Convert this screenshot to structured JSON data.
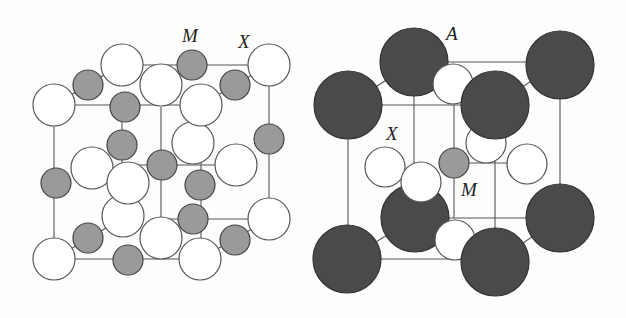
{
  "figure": {
    "panels": [
      {
        "id": "rock-salt",
        "description": "Rock-salt (NaCl-type) MX unit cell",
        "labels": [
          {
            "text": "M",
            "x": 191,
            "y": 42
          },
          {
            "text": "X",
            "x": 244,
            "y": 48
          }
        ]
      },
      {
        "id": "perovskite",
        "description": "Perovskite AMX3 unit cell",
        "labels": [
          {
            "text": "A",
            "x": 446,
            "y": 36
          },
          {
            "text": "X",
            "x": 392,
            "y": 138
          },
          {
            "text": "M",
            "x": 466,
            "y": 192
          }
        ]
      }
    ],
    "legend": {
      "M": "small gray atom (metal cation)",
      "X": "white atom (anion)",
      "A": "large dark atom (A-site cation)"
    },
    "colors": {
      "atom_M": "#9a9a9a",
      "atom_X": "#ffffff",
      "atom_A": "#4a4a4a",
      "edge": "#555555",
      "background": "#fdfdfb"
    }
  },
  "labels": {
    "left_M": "M",
    "left_X": "X",
    "right_A": "A",
    "right_X": "X",
    "right_M": "M"
  }
}
